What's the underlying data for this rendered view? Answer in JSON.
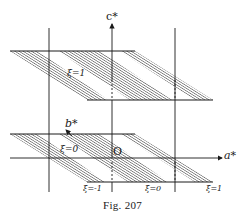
{
  "figure": {
    "caption": "Fig. 207",
    "axes": {
      "c_star": "c*",
      "b_star": "b*",
      "a_star": "a*",
      "origin": "O"
    },
    "upper_plane": {
      "label": "ξ=1"
    },
    "lower_plane": {
      "inner_label": "ξ=0",
      "band_labels": [
        "ξ=-1",
        "ξ=0",
        "ξ=1"
      ]
    },
    "colors": {
      "ink": "#1a1a1a",
      "background": "#ffffff"
    }
  }
}
